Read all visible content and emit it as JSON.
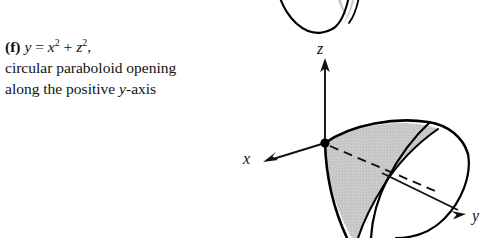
{
  "figure": {
    "part_label": "(f)",
    "equation": {
      "lhs": "y",
      "eq": "=",
      "term1_base": "x",
      "term1_exp": "2",
      "plus": "+",
      "term2_base": "z",
      "term2_exp": "2",
      "trailing_comma": ","
    },
    "description_line1": "circular paraboloid opening",
    "description_line2_prefix": "along the positive ",
    "description_line2_var": "y",
    "description_line2_suffix": "-axis",
    "axes": [
      {
        "name": "z",
        "label": "z",
        "direction": "up"
      },
      {
        "name": "x",
        "label": "x",
        "direction": "left-down"
      },
      {
        "name": "y",
        "label": "y",
        "direction": "right-down"
      }
    ],
    "surface": {
      "type": "circular-paraboloid",
      "opening_axis": "positive-y",
      "cut_face_fill": "#c9c9c9",
      "outline_color": "#000000",
      "body_fill": "#ffffff",
      "origin_marker": "filled-dot"
    },
    "partial_figure_above": {
      "name": "previous-paraboloid-bottom",
      "cut_face_fill": "#c9c9c9"
    }
  }
}
